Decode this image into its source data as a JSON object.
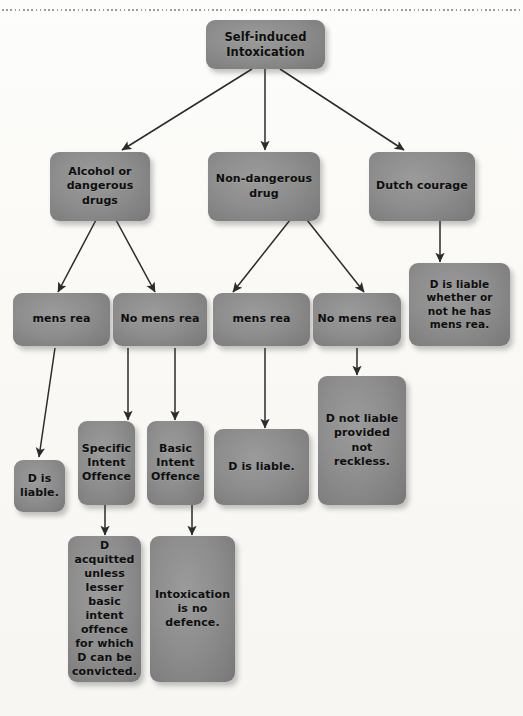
{
  "diagram": {
    "title_rule": "dotted-divider",
    "accent_color": "#8d8d8d",
    "text_color": "#0e0e0e",
    "background_color": "#faf9f6"
  },
  "nodes": {
    "root": "Self-induced\nIntoxication",
    "root_line1": "Self-induced",
    "root_line2": "Intoxication",
    "alcohol": "Alcohol or dangerous drugs",
    "alcohol_l1": "Alcohol or",
    "alcohol_l2": "dangerous",
    "alcohol_l3": "drugs",
    "nondangerous": "Non-dangerous drug",
    "nondangerous_l1": "Non-dangerous",
    "nondangerous_l2": "drug",
    "dutch": "Dutch courage",
    "mens_rea_1": "mens rea",
    "no_mens_rea_1": "No mens rea",
    "mens_rea_2": "mens rea",
    "no_mens_rea_2": "No mens rea",
    "dutch_outcome_l1": "D is liable",
    "dutch_outcome_l2": "whether or",
    "dutch_outcome_l3": "not he has",
    "dutch_outcome_l4": "mens rea.",
    "d_liable_left_l1": "D is",
    "d_liable_left_l2": "liable.",
    "specific_l1": "Specific",
    "specific_l2": "Intent",
    "specific_l3": "Offence",
    "basic_l1": "Basic",
    "basic_l2": "Intent",
    "basic_l3": "Offence",
    "d_liable_mid": "D is liable.",
    "d_not_liable_l1": "D not liable",
    "d_not_liable_l2": "provided not",
    "d_not_liable_l3": "reckless.",
    "acquitted_l1": "D acquitted",
    "acquitted_l2": "unless",
    "acquitted_l3": "lesser basic",
    "acquitted_l4": "intent",
    "acquitted_l5": "offence",
    "acquitted_l6": "for which",
    "acquitted_l7": "D can be",
    "acquitted_l8": "convicted.",
    "intox_l1": "Intoxication",
    "intox_l2": "is no",
    "intox_l3": "defence."
  }
}
